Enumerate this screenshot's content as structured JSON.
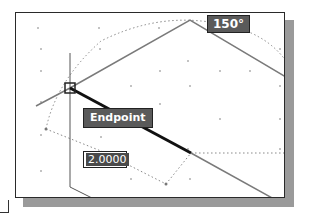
{
  "drawing": {
    "angle_tooltip": "150°",
    "osnap_tooltip": "Endpoint",
    "dynamic_input_value": "2.0000"
  },
  "colors": {
    "background": "#ffffff",
    "tooltip_bg": "#5a5a5a",
    "tooltip_text": "#ffffff",
    "line": "#7a7a7a",
    "rubberband_line": "#111111",
    "shadow": "#9a9a9a"
  },
  "icons": {
    "crosshair": "crosshair-cursor-icon",
    "snap_marker": "endpoint-snap-marker-icon"
  }
}
